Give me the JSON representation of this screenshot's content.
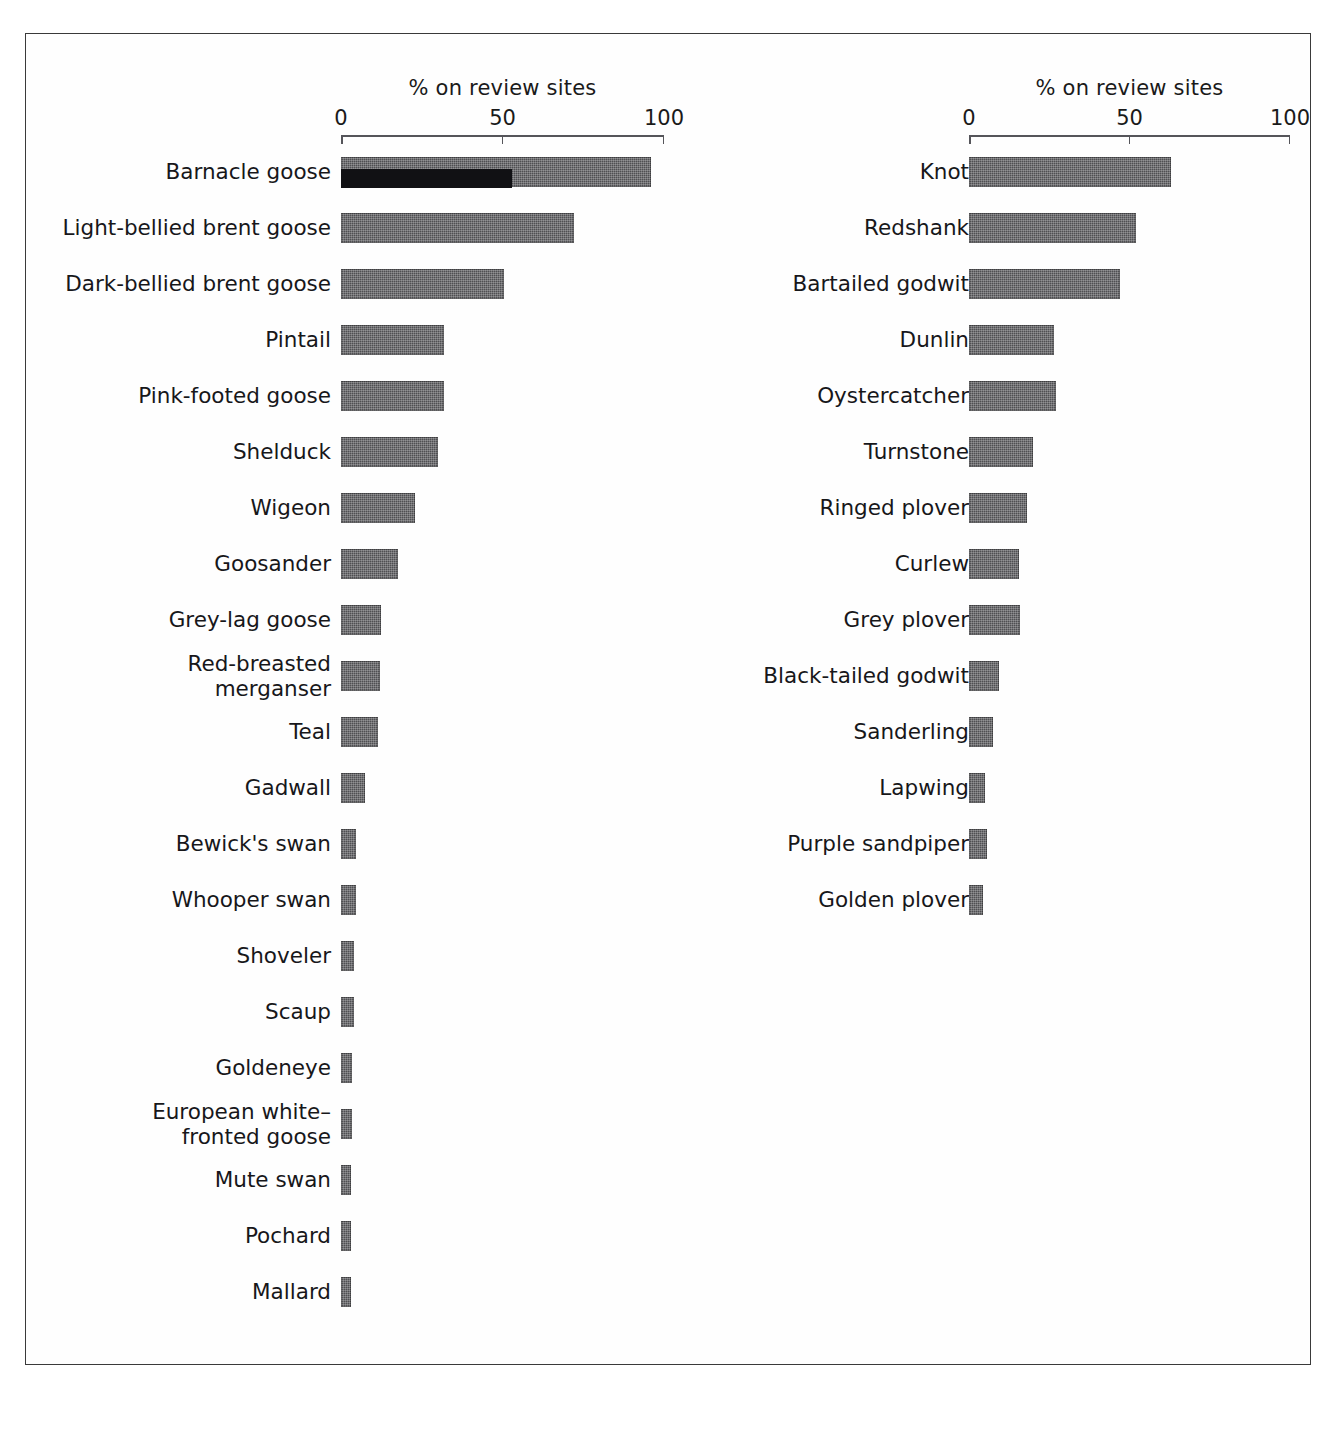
{
  "chart_data": {
    "type": "bar",
    "orientation": "horizontal",
    "title": "",
    "xlabel": "% on review sites",
    "ylabel": "",
    "xlim": [
      0,
      100
    ],
    "grid": false,
    "legend": null,
    "panels": [
      {
        "name": "wildfowl",
        "axis_title": "% on review sites",
        "tick_labels": [
          "0",
          "50",
          "100"
        ],
        "tick_values": [
          0,
          50,
          100
        ],
        "categories": [
          "Barnacle goose",
          "Light-bellied brent goose",
          "Dark-bellied brent goose",
          "Pintail",
          "Pink-footed goose",
          "Shelduck",
          "Wigeon",
          "Goosander",
          "Grey-lag goose",
          "Red-breasted\nmerganser",
          "Teal",
          "Gadwall",
          "Bewick's swan",
          "Whooper swan",
          "Shoveler",
          "Scaup",
          "Goldeneye",
          "European white–\nfronted goose",
          "Mute swan",
          "Pochard",
          "Mallard"
        ],
        "values": [
          96,
          72,
          50.5,
          32,
          32,
          30,
          23,
          17.5,
          12.5,
          12,
          11.5,
          7.5,
          4.5,
          4.5,
          4,
          4,
          3.5,
          3.5,
          3,
          3,
          3
        ],
        "overprint_values": [
          53,
          null,
          null,
          null,
          null,
          null,
          null,
          null,
          null,
          null,
          null,
          null,
          null,
          null,
          null,
          null,
          null,
          null,
          null,
          null,
          null
        ]
      },
      {
        "name": "waders",
        "axis_title": "% on review sites",
        "tick_labels": [
          "0",
          "50",
          "100"
        ],
        "tick_values": [
          0,
          50,
          100
        ],
        "categories": [
          "Knot",
          "Redshank",
          "Bartailed godwit",
          "Dunlin",
          "Oystercatcher",
          "Turnstone",
          "Ringed plover",
          "Curlew",
          "Grey plover",
          "Black-tailed godwit",
          "Sanderling",
          "Lapwing",
          "Purple sandpiper",
          "Golden plover"
        ],
        "values": [
          63,
          52,
          47,
          26.5,
          27,
          20,
          18,
          15.5,
          16,
          9.5,
          7.5,
          5,
          5.5,
          4.5
        ],
        "overprint_values": [
          null,
          null,
          null,
          null,
          null,
          null,
          null,
          null,
          null,
          null,
          null,
          null,
          null,
          null
        ]
      }
    ]
  }
}
